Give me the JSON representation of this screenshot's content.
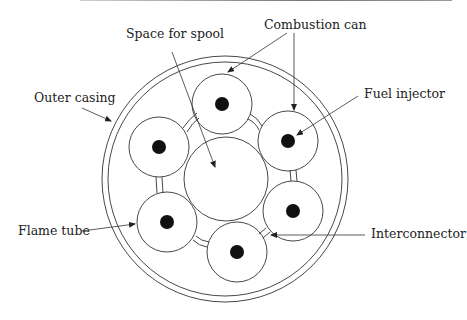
{
  "labels": {
    "space_for_spool": "Space for spool",
    "combustion_can": "Combustion can",
    "outer_casing": "Outer casing",
    "fuel_injector": "Fuel injector",
    "flame_tube": "Flame tube",
    "interconnector": "Interconnector"
  },
  "colors": {
    "stroke": "#333333",
    "injector_fill": "#111111",
    "background": "#ffffff"
  }
}
